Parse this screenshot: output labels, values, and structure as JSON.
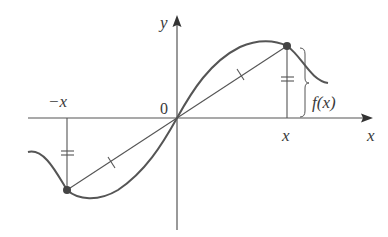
{
  "diagram": {
    "labels": {
      "y_axis": "y",
      "x_axis": "x",
      "origin": "0",
      "neg_x": "−x",
      "pos_x": "x",
      "fx": "f(x)"
    },
    "colors": {
      "axis": "#555555",
      "curve": "#555555",
      "text": "#3a3a3a",
      "point": "#444444",
      "background": "#ffffff"
    }
  }
}
